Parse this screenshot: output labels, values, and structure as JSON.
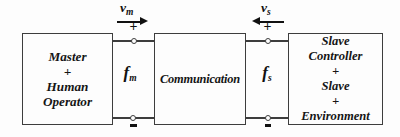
{
  "diagram": {
    "colors": {
      "border": "#3d3d3d",
      "text": "#111111",
      "background": "#fdfdfd"
    },
    "blocks": {
      "master": {
        "lines": [
          "Master",
          "+",
          "Human",
          "Operator"
        ]
      },
      "communication": {
        "lines": [
          "Communication"
        ]
      },
      "slave": {
        "lines": [
          "Slave",
          "Controller",
          "+",
          "Slave",
          "+",
          "Environment"
        ]
      }
    },
    "signals": {
      "vm": {
        "base": "v",
        "sub": "m",
        "direction": "right"
      },
      "vs": {
        "base": "v",
        "sub": "s",
        "direction": "left"
      },
      "fm": {
        "base": "f",
        "sub": "m"
      },
      "fs": {
        "base": "f",
        "sub": "s"
      }
    },
    "terminals": {
      "plus": "+",
      "minus": ""
    },
    "icons": {
      "vm_arrow": "arrow-right",
      "vs_arrow": "arrow-left"
    }
  }
}
